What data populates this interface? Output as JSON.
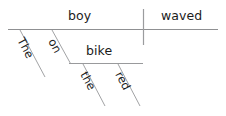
{
  "diagram": {
    "kind": "sentence-diagram",
    "sentence": "The boy on the bike waved.",
    "canvas": {
      "width": 226,
      "height": 116,
      "background": "#ffffff"
    },
    "colors": {
      "line": "#999a9c",
      "text": "#1b1b1b",
      "background": "#ffffff"
    },
    "words": {
      "subject": "boy",
      "verb": "waved",
      "subject_article": "The",
      "preposition": "on",
      "object_of_preposition": "bike",
      "object_article": "the",
      "object_adjective": "red"
    },
    "labels": {
      "baseline": "main-baseline",
      "divider": "subject-verb-divider"
    }
  }
}
